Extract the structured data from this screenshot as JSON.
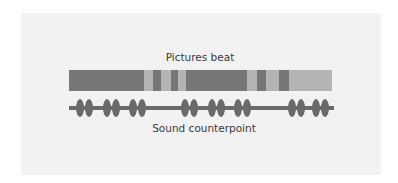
{
  "diagram": {
    "top_label": "Pictures beat",
    "bottom_label": "Sound counterpoint",
    "colors": {
      "background": "#ffffff",
      "panel": "#f2f2f2",
      "dark_segment": "#777777",
      "light_segment": "#b4b4b4",
      "wave": "#6a6a6a"
    },
    "picture_segments": [
      {
        "x": 0,
        "w": 75,
        "tone": "dark"
      },
      {
        "x": 75,
        "w": 9,
        "tone": "light"
      },
      {
        "x": 84,
        "w": 8,
        "tone": "dark"
      },
      {
        "x": 92,
        "w": 10,
        "tone": "light"
      },
      {
        "x": 102,
        "w": 7,
        "tone": "dark"
      },
      {
        "x": 109,
        "w": 8,
        "tone": "light"
      },
      {
        "x": 117,
        "w": 61,
        "tone": "dark"
      },
      {
        "x": 178,
        "w": 10,
        "tone": "light"
      },
      {
        "x": 188,
        "w": 9,
        "tone": "dark"
      },
      {
        "x": 197,
        "w": 13,
        "tone": "light"
      },
      {
        "x": 210,
        "w": 10,
        "tone": "dark"
      },
      {
        "x": 220,
        "w": 43,
        "tone": "light"
      }
    ],
    "sound_beats_x": [
      80,
      89,
      107,
      116,
      133,
      142,
      185,
      194,
      212,
      221,
      238,
      247,
      292,
      301,
      316,
      325
    ]
  }
}
